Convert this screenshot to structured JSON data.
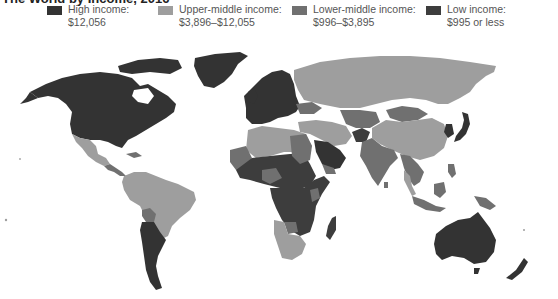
{
  "title": "The World by Income, 2016",
  "legend": {
    "items": [
      {
        "key": "high",
        "label": "High income:",
        "range": "$12,056",
        "color": "#333333"
      },
      {
        "key": "upper_middle",
        "label": "Upper-middle income:",
        "range": "$3,896–$12,055",
        "color": "#9e9e9e"
      },
      {
        "key": "lower_middle",
        "label": "Lower-middle income:",
        "range": "$996–$3,895",
        "color": "#707070"
      },
      {
        "key": "low",
        "label": "Low income:",
        "range": "$995 or less",
        "color": "#3d3d3d"
      }
    ]
  },
  "map": {
    "regions": [
      {
        "name": "North America (USA, Canada)",
        "category": "high"
      },
      {
        "name": "Greenland",
        "category": "high"
      },
      {
        "name": "Mexico",
        "category": "upper_middle"
      },
      {
        "name": "Central America",
        "category": "lower_middle"
      },
      {
        "name": "Brazil / northern South America",
        "category": "upper_middle"
      },
      {
        "name": "Bolivia",
        "category": "lower_middle"
      },
      {
        "name": "Argentina / Chile",
        "category": "high"
      },
      {
        "name": "Western Europe",
        "category": "high"
      },
      {
        "name": "Russia",
        "category": "upper_middle"
      },
      {
        "name": "Ukraine",
        "category": "lower_middle"
      },
      {
        "name": "North Africa",
        "category": "upper_middle"
      },
      {
        "name": "Sahel / West Africa",
        "category": "low"
      },
      {
        "name": "Central & East Africa",
        "category": "low"
      },
      {
        "name": "Southern Africa",
        "category": "upper_middle"
      },
      {
        "name": "Madagascar",
        "category": "low"
      },
      {
        "name": "Saudi Arabia / Gulf",
        "category": "high"
      },
      {
        "name": "Afghanistan",
        "category": "low"
      },
      {
        "name": "Central Asia",
        "category": "lower_middle"
      },
      {
        "name": "Mongolia",
        "category": "lower_middle"
      },
      {
        "name": "China",
        "category": "upper_middle"
      },
      {
        "name": "India",
        "category": "lower_middle"
      },
      {
        "name": "Southeast Asia",
        "category": "lower_middle"
      },
      {
        "name": "Japan / Korea",
        "category": "high"
      },
      {
        "name": "Indonesia",
        "category": "lower_middle"
      },
      {
        "name": "Papua New Guinea",
        "category": "lower_middle"
      },
      {
        "name": "Australia",
        "category": "high"
      },
      {
        "name": "New Zealand",
        "category": "high"
      }
    ]
  }
}
